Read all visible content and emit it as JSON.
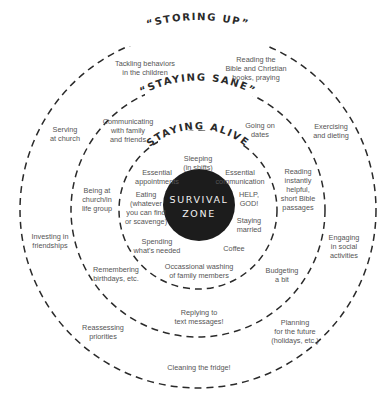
{
  "diagram": {
    "type": "concentric-rings",
    "colors": {
      "background": "#ffffff",
      "ring_stroke": "#2a2a2a",
      "core_fill": "#1c1c1c",
      "core_text": "#f2f2f2",
      "label_text": "#555555"
    },
    "core": {
      "line1": "SURVIVAL",
      "line2": "ZONE"
    },
    "rings": [
      {
        "title": "“STAYING ALIVE”",
        "items": [
          "Sleeping\n(in shifts)",
          "Essential\nappointments",
          "Essential\ncommunication",
          "Eating\n(whatever\nyou can find\nor scavenge)",
          "HELP,\nGOD!",
          "Staying\nmarried",
          "Spending\nwhat's needed",
          "Coffee"
        ]
      },
      {
        "title": "“STAYING SANE”",
        "items": [
          "Communicating\nwith family\nand friends",
          "Going on\ndates",
          "Being at\nchurch/in\nlife group",
          "Reading\ninstantly\nhelpful,\nshort Bible\npassages",
          "Remembering\nbirthdays, etc.",
          "Occassional washing\nof family members",
          "Budgeting\na bit"
        ]
      },
      {
        "title": "“STORING UP”",
        "items": [
          "Tackling behaviors\nin the children",
          "Reading the\nBible and Christian\nbooks, praying",
          "Serving\nat church",
          "Exercising\nand dieting",
          "Investing in\nfriendships",
          "Engaging\nin social\nactivities",
          "Replying to\ntext messages!",
          "Reassessing\npriorities",
          "Planning\nfor the future\n(holidays, etc.)",
          "Cleaning the fridge!"
        ]
      }
    ]
  }
}
